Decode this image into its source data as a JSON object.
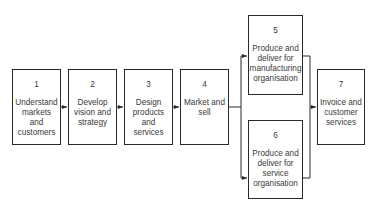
{
  "diagram": {
    "type": "process-flow",
    "nodes": [
      {
        "id": "1",
        "number": "1",
        "label": "Understand markets and customers"
      },
      {
        "id": "2",
        "number": "2",
        "label": "Develop vision and strategy"
      },
      {
        "id": "3",
        "number": "3",
        "label": "Design products and services"
      },
      {
        "id": "4",
        "number": "4",
        "label": "Market and sell"
      },
      {
        "id": "5",
        "number": "5",
        "label": "Produce and deliver for manufacturing organisation"
      },
      {
        "id": "6",
        "number": "6",
        "label": "Produce and deliver for service organisation"
      },
      {
        "id": "7",
        "number": "7",
        "label": "Invoice and customer services"
      }
    ],
    "edges": [
      {
        "from": "1",
        "to": "2"
      },
      {
        "from": "2",
        "to": "3"
      },
      {
        "from": "3",
        "to": "4"
      },
      {
        "from": "4",
        "to": "5"
      },
      {
        "from": "4",
        "to": "6"
      },
      {
        "from": "5",
        "to": "7"
      },
      {
        "from": "6",
        "to": "7"
      }
    ],
    "colors": {
      "stroke": "#2a2a2a",
      "text": "#3a3a3a",
      "background": "#ffffff"
    }
  }
}
